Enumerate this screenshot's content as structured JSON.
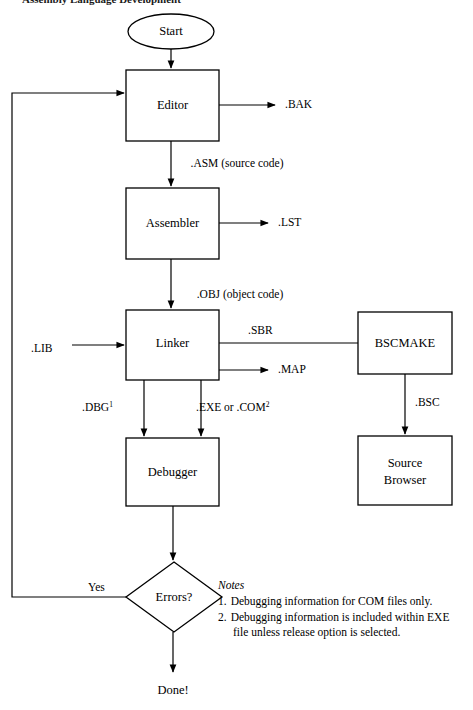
{
  "page": {
    "caption_partial": "Assembly Language Development"
  },
  "diagram": {
    "nodes": [
      {
        "id": "start",
        "label": "Start",
        "shape": "ellipse",
        "x": 128,
        "y": 14,
        "w": 86,
        "h": 35
      },
      {
        "id": "editor",
        "label": "Editor",
        "shape": "rectangle",
        "x": 126,
        "y": 70,
        "w": 93,
        "h": 71
      },
      {
        "id": "assembler",
        "label": "Assembler",
        "shape": "rectangle",
        "x": 126,
        "y": 188,
        "w": 93,
        "h": 71
      },
      {
        "id": "linker",
        "label": "Linker",
        "shape": "rectangle",
        "x": 126,
        "y": 310,
        "w": 93,
        "h": 70
      },
      {
        "id": "bscmake",
        "label": "BSCMAKE",
        "shape": "rectangle",
        "x": 358,
        "y": 312,
        "w": 94,
        "h": 62
      },
      {
        "id": "debugger",
        "label": "Debugger",
        "shape": "rectangle",
        "x": 126,
        "y": 438,
        "w": 93,
        "h": 68
      },
      {
        "id": "browser",
        "label": "Source Browser",
        "shape": "rectangle",
        "x": 358,
        "y": 436,
        "w": 94,
        "h": 69,
        "label_lines": [
          "Source",
          "Browser"
        ]
      },
      {
        "id": "errors",
        "label": "Errors?",
        "shape": "diamond",
        "x": 126,
        "y": 562,
        "w": 96,
        "h": 70
      }
    ],
    "edge_labels": [
      {
        "id": "bak",
        "text": ".BAK",
        "x": 285,
        "y": 104
      },
      {
        "id": "asm",
        "text": ".ASM (source code)",
        "x": 182,
        "y": 164
      },
      {
        "id": "lst",
        "text": ".LST",
        "x": 278,
        "y": 222
      },
      {
        "id": "obj",
        "text": ".OBJ (object code)",
        "x": 182,
        "y": 295
      },
      {
        "id": "lib",
        "text": ".LIB",
        "x": 35,
        "y": 349
      },
      {
        "id": "sbr",
        "text": ".SBR",
        "x": 250,
        "y": 331
      },
      {
        "id": "map",
        "text": ".MAP",
        "x": 278,
        "y": 370
      },
      {
        "id": "bsc",
        "text": ".BSC",
        "x": 418,
        "y": 403
      },
      {
        "id": "dbg",
        "text": ".DBG",
        "sup": "1",
        "x": 82,
        "y": 408
      },
      {
        "id": "exe",
        "text": ".EXE or .COM",
        "sup": "2",
        "x": 196,
        "y": 408
      },
      {
        "id": "yes",
        "text": "Yes",
        "x": 88,
        "y": 588
      }
    ],
    "terminal": {
      "id": "done",
      "text": "Done!",
      "x": 173,
      "y": 690
    },
    "notes": {
      "heading": "Notes",
      "items": [
        {
          "number": "1.",
          "lines": [
            "Debugging information for COM files only."
          ]
        },
        {
          "number": "2.",
          "lines": [
            "Debugging information is included within EXE",
            "file unless release option is selected."
          ]
        }
      ],
      "x": 218,
      "y": 586
    },
    "colors": {
      "stroke": "#000000",
      "fill": "#ffffff",
      "text": "#000000",
      "background": "#ffffff"
    }
  }
}
